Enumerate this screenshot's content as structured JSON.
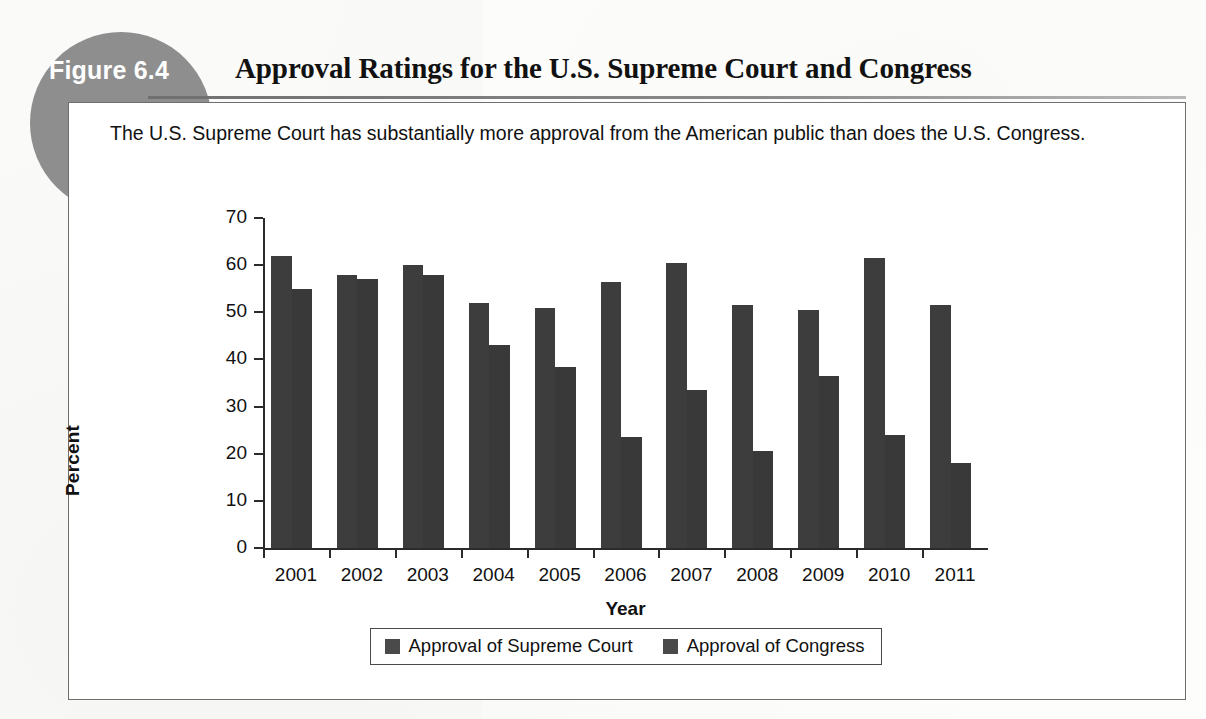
{
  "figure": {
    "badge_label": "Figure 6.4",
    "title": "Approval Ratings for the U.S. Supreme Court and Congress",
    "caption": "The U.S. Supreme Court has substantially more approval from the American public than does the U.S. Congress.",
    "badge_color": "#8e8e8e",
    "border_color": "#6e6e6e",
    "bar_color": "#3b3b3b"
  },
  "chart_data": {
    "type": "bar",
    "title": "Approval Ratings for the U.S. Supreme Court and Congress",
    "xlabel": "Year",
    "ylabel": "Percent",
    "ylim": [
      0,
      70
    ],
    "yticks": [
      0,
      10,
      20,
      30,
      40,
      50,
      60,
      70
    ],
    "grid": false,
    "legend_position": "bottom",
    "categories": [
      "2001",
      "2002",
      "2003",
      "2004",
      "2005",
      "2006",
      "2007",
      "2008",
      "2009",
      "2010",
      "2011"
    ],
    "series": [
      {
        "name": "Approval of Supreme Court",
        "color": "#3d3d3d",
        "values": [
          62,
          58,
          60,
          52,
          51,
          56.5,
          60.5,
          51.5,
          50.5,
          61.5,
          51.5
        ]
      },
      {
        "name": "Approval of Congress",
        "color": "#393939",
        "values": [
          55,
          57,
          58,
          43,
          38.5,
          23.5,
          33.5,
          20.5,
          36.5,
          24,
          18
        ]
      }
    ]
  }
}
